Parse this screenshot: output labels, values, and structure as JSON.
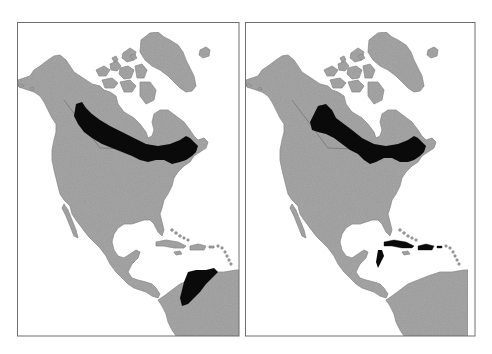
{
  "figure": {
    "colors": {
      "background": "#ffffff",
      "land": "#9a9a9a",
      "land_texture": "#7e7e7e",
      "range": "#0a0a0a",
      "frame": "#6e6e6e",
      "water": "#ffffff"
    },
    "panels": [
      {
        "id": "left",
        "range_regions": [
          "boreal belt from Yukon/NWT across southern Canada to the Maritimes",
          "northwestern South America (Colombia/Venezuela)"
        ]
      },
      {
        "id": "right",
        "range_regions": [
          "boreal belt from Yukon/NWT across southern Canada to the Maritimes",
          "Greater Antilles (Cuba, Hispaniola) and Lesser Antilles islands",
          "Caribbean coast of Yucatan/Belize"
        ]
      }
    ]
  }
}
